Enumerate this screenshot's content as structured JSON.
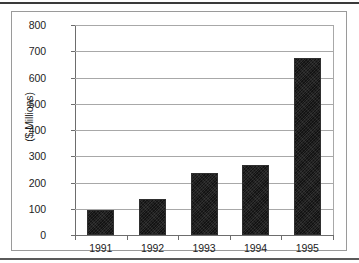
{
  "chart_data": {
    "type": "bar",
    "title": "",
    "subtitle": "",
    "xlabel": "",
    "ylabel": "($ Millions)",
    "categories": [
      "1991",
      "1992",
      "1993",
      "1994",
      "1995"
    ],
    "values": [
      97,
      138,
      238,
      268,
      674
    ],
    "series": [
      {
        "name": "",
        "values": [
          97,
          138,
          238,
          268,
          674
        ]
      }
    ],
    "ylim": [
      0,
      800
    ],
    "ytick_labels": [
      "800",
      "700",
      "600",
      "500",
      "400",
      "300",
      "200",
      "100",
      "0"
    ],
    "ytick_values": [
      800,
      700,
      600,
      500,
      400,
      300,
      200,
      100,
      0
    ],
    "ytick_step": 100,
    "grid": true,
    "grid_axis": "y",
    "legend": false,
    "legend_position": "none",
    "bar_color": "#262626",
    "gridline_color": "#a8a8a8",
    "axis_color": "#6d6d6d",
    "frame_color": "#9a9a9a",
    "text_color": "#1d1d1d",
    "background": "#ffffff"
  },
  "figure": {
    "top_rule": "",
    "bottom_rule": "",
    "frame_label": ""
  }
}
